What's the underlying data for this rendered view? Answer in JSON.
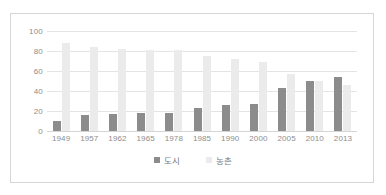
{
  "chart_data": {
    "type": "bar",
    "title": "",
    "subtitle": "",
    "xlabel": "",
    "ylabel": "",
    "categories": [
      "1949",
      "1957",
      "1962",
      "1965",
      "1978",
      "1985",
      "1990",
      "2000",
      "2005",
      "2010",
      "2013"
    ],
    "series": [
      {
        "name": "도시",
        "color": "#8c8c8c",
        "values": [
          10,
          16,
          17,
          18,
          18,
          23,
          26,
          27,
          43,
          50,
          54
        ]
      },
      {
        "name": "농촌",
        "color": "#ebebeb",
        "values": [
          88,
          84,
          82,
          81,
          81,
          75,
          72,
          69,
          57,
          50,
          46
        ]
      }
    ],
    "ylim": [
      0,
      100
    ],
    "yticks": [
      0,
      20,
      40,
      60,
      80,
      100
    ],
    "ytick_labels": [
      "0",
      "20",
      "40",
      "60",
      "80",
      "100"
    ],
    "grid": true,
    "grid_axis": "y",
    "legend_position": "bottom",
    "legend_entries": [
      "도시",
      "농촌"
    ]
  },
  "legend": {
    "urban_label": "도시",
    "rural_label": "농촌"
  },
  "colors": {
    "urban": "#8c8c8c",
    "rural": "#ebebeb",
    "grid": "#e4e4e4",
    "axis_text": "#8d8d8d",
    "border": "#d6d6d6"
  }
}
